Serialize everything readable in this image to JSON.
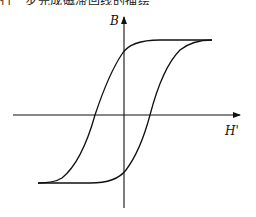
{
  "caption": "行一步完成磁滞回线的描绘",
  "diagram": {
    "type": "hysteresis-loop",
    "y_axis_label": "B",
    "x_axis_label": "H'",
    "features": {
      "remanence_positive": true,
      "remanence_negative": true,
      "coercivity_positive": true,
      "coercivity_negative": true,
      "saturation_positive": true,
      "saturation_negative": true
    }
  }
}
